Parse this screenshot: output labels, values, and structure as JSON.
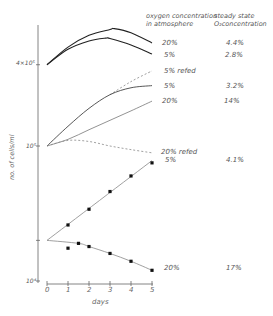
{
  "chart_data": {
    "type": "line",
    "title": "",
    "xlabel": "days",
    "ylabel": "no. of cells/ml",
    "yscale": "log",
    "ylim": [
      10000,
      800000
    ],
    "xlim": [
      0,
      5
    ],
    "x_ticks": [
      "0",
      "1",
      "2",
      "3",
      "4",
      "5"
    ],
    "y_ticks": [
      {
        "value": 10000,
        "label": "10⁴"
      },
      {
        "value": 20000,
        "label": ""
      },
      {
        "value": 100000,
        "label": "10⁵"
      },
      {
        "value": 400000,
        "label": "4×10⁵"
      }
    ],
    "grid": false,
    "legend_headers": {
      "col1": "oxygen concentration in atmosphere",
      "col2": "steady state O₂concentration"
    },
    "series": [
      {
        "name": "20% (high density)",
        "oxygen": "20%",
        "steady_state_o2": "4.4%",
        "style": "solid-bold",
        "x": [
          0,
          1,
          2,
          3,
          3.2,
          4,
          5
        ],
        "y": [
          400000,
          540000,
          660000,
          730000,
          740000,
          690000,
          580000
        ]
      },
      {
        "name": "5% (high density)",
        "oxygen": "5%",
        "steady_state_o2": "2.8%",
        "style": "solid-bold",
        "x": [
          0,
          1,
          2,
          2.8,
          3,
          4,
          5
        ],
        "y": [
          400000,
          520000,
          600000,
          630000,
          625000,
          560000,
          480000
        ]
      },
      {
        "name": "5% refed",
        "oxygen": "5% refed",
        "steady_state_o2": "",
        "style": "dashed",
        "x": [
          3,
          4,
          5
        ],
        "y": [
          240000,
          300000,
          360000
        ]
      },
      {
        "name": "5% (mid density)",
        "oxygen": "5%",
        "steady_state_o2": "3.2%",
        "style": "solid",
        "x": [
          0,
          1,
          2,
          3,
          4,
          5
        ],
        "y": [
          100000,
          140000,
          190000,
          240000,
          270000,
          280000
        ]
      },
      {
        "name": "20% (mid density)",
        "oxygen": "20%",
        "steady_state_o2": "14%",
        "style": "solid",
        "x": [
          0,
          1,
          2,
          3,
          4,
          5
        ],
        "y": [
          100000,
          112000,
          132000,
          155000,
          182000,
          215000
        ]
      },
      {
        "name": "20% refed",
        "oxygen": "20% refed",
        "steady_state_o2": "",
        "style": "dashed",
        "x": [
          0,
          1,
          2,
          3,
          4,
          5
        ],
        "y": [
          100000,
          110000,
          108000,
          100000,
          94000,
          89000
        ]
      },
      {
        "name": "5% (low density)",
        "oxygen": "5%",
        "steady_state_o2": "4.1%",
        "style": "solid-with-points",
        "x": [
          0,
          1,
          2,
          3,
          4,
          5
        ],
        "y": [
          20000,
          26000,
          34000,
          46000,
          60000,
          75000
        ]
      },
      {
        "name": "20% (low density)",
        "oxygen": "20%",
        "steady_state_o2": "17%",
        "style": "solid-with-points",
        "x": [
          0,
          1,
          1.5,
          2,
          3,
          4,
          5
        ],
        "y": [
          20000,
          17500,
          19000,
          18000,
          16000,
          14000,
          12000
        ]
      }
    ]
  },
  "labels": {
    "header_col1_line1": "oxygen concentration",
    "header_col1_line2": "in atmosphere",
    "header_col2_line1": "steady state",
    "header_col2_line2": "O₂concentration",
    "rows": [
      {
        "oxygen": "20%",
        "steady": "4.4%"
      },
      {
        "oxygen": "5%",
        "steady": "2.8%"
      },
      {
        "oxygen": "5% refed",
        "steady": ""
      },
      {
        "oxygen": "5%",
        "steady": "3.2%"
      },
      {
        "oxygen": "20%",
        "steady": "14%"
      },
      {
        "oxygen": "20% refed",
        "steady": ""
      },
      {
        "oxygen": "5%",
        "steady": "4.1%"
      },
      {
        "oxygen": "20%",
        "steady": "17%"
      }
    ],
    "y_tick_4e5": "4×10⁵",
    "y_tick_1e5": "10⁵",
    "y_tick_1e4": "10⁴",
    "y_axis_label": "no. of cells/ml",
    "x_axis_label": "days",
    "x_ticks": [
      "0",
      "1",
      "2",
      "3",
      "4",
      "5"
    ]
  }
}
